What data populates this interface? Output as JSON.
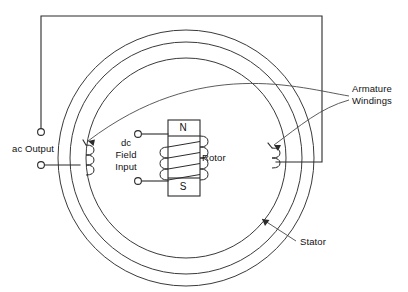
{
  "diagram": {
    "labels": {
      "ac_output": "ac Output",
      "dc_field_input_line1": "dc",
      "dc_field_input_line2": "Field",
      "dc_field_input_line3": "Input",
      "rotor": "Rotor",
      "armature_windings_line1": "Armature",
      "armature_windings_line2": "Windings",
      "stator": "Stator",
      "pole_north": "N",
      "pole_south": "S"
    },
    "colors": {
      "background": "#ffffff",
      "wire": "#2b2b2b",
      "ring": "#3a3a3a",
      "leader": "#4a4a4a",
      "text": "#111111"
    },
    "geometry": {
      "center_x": 186,
      "center_y": 158,
      "ring_outer_r": 128,
      "ring_middle_r": 116,
      "ring_inner_r": 100,
      "rotor_box": {
        "x": 168,
        "y": 120,
        "w": 32,
        "h": 76
      },
      "rotor_coil_turns": 4,
      "armature_coil_turns": 3,
      "circuit_top_y": 16,
      "circuit_left_x": 41,
      "circuit_right_x": 322,
      "circuit_bottom_y": 162,
      "ac_terminal_top": {
        "x": 41,
        "y": 132
      },
      "ac_terminal_bottom": {
        "x": 41,
        "y": 165
      },
      "dc_terminal_top": {
        "x": 138,
        "y": 134
      },
      "dc_terminal_bottom": {
        "x": 138,
        "y": 181
      }
    }
  }
}
